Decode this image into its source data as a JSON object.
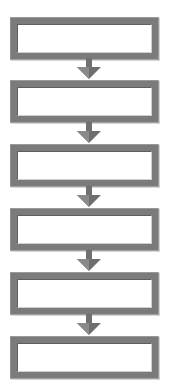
{
  "diagram": {
    "type": "vertical-flowchart",
    "colors": {
      "frame": "#7b7b7b",
      "fill": "#ffffff",
      "arrow": "#6e6e6e"
    },
    "steps": [
      {
        "label": ""
      },
      {
        "label": ""
      },
      {
        "label": ""
      },
      {
        "label": ""
      },
      {
        "label": ""
      },
      {
        "label": ""
      }
    ],
    "connectors": [
      {
        "from": 0,
        "to": 1,
        "icon": "arrow-down-icon"
      },
      {
        "from": 1,
        "to": 2,
        "icon": "arrow-down-icon"
      },
      {
        "from": 2,
        "to": 3,
        "icon": "arrow-down-icon"
      },
      {
        "from": 3,
        "to": 4,
        "icon": "arrow-down-icon"
      },
      {
        "from": 4,
        "to": 5,
        "icon": "arrow-down-icon"
      }
    ]
  }
}
